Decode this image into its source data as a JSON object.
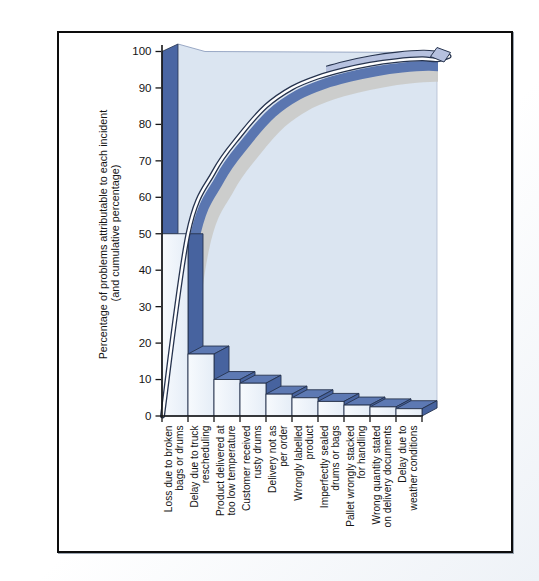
{
  "chart_data": {
    "type": "bar",
    "subtype": "pareto-3d",
    "title": "",
    "ylabel": "Percentage of problems attributable to each incident",
    "ylabel_line2": "(and cumulative percentage)",
    "categories": [
      "Loss due to broken\nbags or drums",
      "Delay due to truck\nrescheduling",
      "Product delivered at\ntoo low temperature",
      "Customer received\nrusty drums",
      "Delivery not as\nper order",
      "Wrongly labelled\nproduct",
      "Imperfectly sealed\ndrums or bags",
      "Pallet wrongly stacked\nfor handling",
      "Wrong quantity stated\non delivery documents",
      "Delay due to\nweather conditions"
    ],
    "values": [
      50,
      17,
      10,
      9,
      6,
      5,
      4,
      3,
      2.5,
      2
    ],
    "cumulative": [
      50,
      67,
      77,
      85,
      90,
      93,
      95,
      96.5,
      97.5,
      98
    ],
    "y_ticks": [
      0,
      10,
      20,
      30,
      40,
      50,
      60,
      70,
      80,
      90,
      100
    ],
    "ylim": [
      0,
      100
    ],
    "grid": false,
    "legend": "none",
    "colors": {
      "bar_front": "#f4f7fc",
      "bar_front_shade": "#e5edf7",
      "bar_top": "#5d79b3",
      "bar_side": "#47639f",
      "wall_stripe": "#4a66a3",
      "panel": "#dbe5f1",
      "panel_edge": "#8496b8",
      "ribbon": "#5a76b0",
      "ribbon_top": "#b6c1df",
      "shadow": "#c9c9c6",
      "outline": "#26334e",
      "axis": "#161616",
      "text": "#141414"
    }
  }
}
